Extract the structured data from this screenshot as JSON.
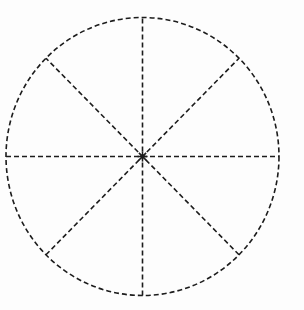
{
  "figure": {
    "background_color": "#fdfdfd",
    "stroke_color": "#1c1c1c",
    "width": 304,
    "height": 310,
    "caption": ""
  },
  "chart_data": {
    "type": "pie",
    "subtitle": "",
    "xlabel": "",
    "ylabel": "",
    "grid": false,
    "legend_position": "none",
    "style": {
      "line_style": "dashed",
      "dash_length": 5,
      "gap_length": 3,
      "line_width": 1.6,
      "fill": "none",
      "stroke_color": "#1c1c1c",
      "background_color": "#fdfdfd"
    },
    "geometry": {
      "center_x": 142.5,
      "center_y": 156.5,
      "radius_x": 136.5,
      "radius_y": 139.0,
      "shape": "circle"
    },
    "categories": [
      "Sector 1",
      "Sector 2",
      "Sector 3",
      "Sector 4",
      "Sector 5",
      "Sector 6",
      "Sector 7",
      "Sector 8"
    ],
    "values": [
      12.5,
      12.5,
      12.5,
      12.5,
      12.5,
      12.5,
      12.5,
      12.5
    ],
    "slice_angle_degrees": 45,
    "slice_count": 8,
    "labels": [],
    "annotations": [],
    "diameters": [
      {
        "name": "vertical-diameter",
        "angle_degrees": 90
      },
      {
        "name": "horizontal-diameter",
        "angle_degrees": 0
      },
      {
        "name": "diagonal-diameter-ne-sw",
        "angle_degrees": 45
      },
      {
        "name": "diagonal-diameter-nw-se",
        "angle_degrees": 135
      }
    ]
  }
}
